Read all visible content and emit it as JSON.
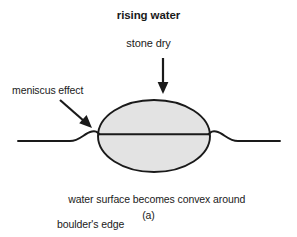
{
  "figure": {
    "panel_label": "(a)",
    "labels": {
      "rising_water": "rising water",
      "stone_dry": "stone dry",
      "meniscus_effect": "meniscus effect",
      "caption_line1": "water surface becomes convex around",
      "caption_line2": "boulder's edge"
    },
    "colors": {
      "background": "#ffffff",
      "stroke": "#1a1a1a",
      "boulder_fill": "#e3e3e3",
      "text": "#1a1a1a"
    },
    "elements": {
      "boulder": "ellipse-boulder",
      "water_line": "water-surface-line",
      "down_arrow": "down-arrow",
      "meniscus_arrow": "meniscus-pointer-arrow"
    }
  }
}
